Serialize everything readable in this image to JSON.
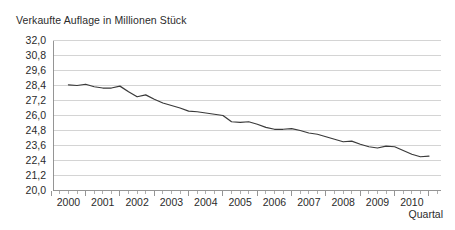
{
  "chart_data": {
    "type": "line",
    "title": "Verkaufte Auflage in Millionen Stück",
    "xlabel": "Quartal",
    "ylabel": "",
    "ylim": [
      20.0,
      32.0
    ],
    "ytick_step": 1.2,
    "ytick_labels": [
      "32,0",
      "30,8",
      "29,6",
      "28,4",
      "27,2",
      "26,0",
      "24,8",
      "23,6",
      "22,4",
      "21,2",
      "20,0"
    ],
    "ytick_values": [
      32.0,
      30.8,
      29.6,
      28.4,
      27.2,
      26.0,
      24.8,
      23.6,
      22.4,
      21.2,
      20.0
    ],
    "xtick_labels": [
      "2000",
      "2001",
      "2002",
      "2003",
      "2004",
      "2005",
      "2006",
      "2007",
      "2008",
      "2009",
      "2010"
    ],
    "xtick_values": [
      2000,
      2001,
      2002,
      2003,
      2004,
      2005,
      2006,
      2007,
      2008,
      2009,
      2010
    ],
    "x_minor_per_major": 4,
    "grid": "horizontal",
    "legend": "none",
    "series": [
      {
        "name": "Verkaufte Auflage",
        "x": [
          2000.0,
          2000.25,
          2000.5,
          2000.75,
          2001.0,
          2001.25,
          2001.5,
          2001.75,
          2002.0,
          2002.25,
          2002.5,
          2002.75,
          2003.0,
          2003.25,
          2003.5,
          2003.75,
          2004.0,
          2004.25,
          2004.5,
          2004.75,
          2005.0,
          2005.25,
          2005.5,
          2005.75,
          2006.0,
          2006.25,
          2006.5,
          2006.75,
          2007.0,
          2007.25,
          2007.5,
          2007.75,
          2008.0,
          2008.25,
          2008.5,
          2008.75,
          2009.0,
          2009.25,
          2009.5,
          2009.75,
          2010.0,
          2010.25,
          2010.5
        ],
        "values": [
          28.45,
          28.4,
          28.5,
          28.3,
          28.2,
          28.2,
          28.35,
          27.9,
          27.5,
          27.65,
          27.3,
          27.0,
          26.8,
          26.6,
          26.35,
          26.3,
          26.2,
          26.1,
          26.0,
          25.5,
          25.45,
          25.5,
          25.3,
          25.05,
          24.9,
          24.9,
          24.95,
          24.8,
          24.6,
          24.5,
          24.3,
          24.1,
          23.9,
          23.95,
          23.7,
          23.5,
          23.4,
          23.55,
          23.5,
          23.2,
          22.9,
          22.7,
          22.75
        ],
        "color": "#3a3a3a"
      }
    ],
    "colors": {
      "line": "#3a3a3a",
      "grid": "#c9c9c9",
      "axis": "#8a8a8a",
      "text": "#2b2b2b",
      "background": "#ffffff"
    }
  }
}
